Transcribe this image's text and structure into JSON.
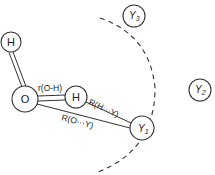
{
  "diagram": {
    "atoms": {
      "h_top": {
        "label": "H",
        "cx": 11,
        "cy": 42,
        "r": 10
      },
      "o": {
        "label": "O",
        "cx": 25,
        "cy": 99,
        "r": 13
      },
      "h_right": {
        "label": "H",
        "cx": 76,
        "cy": 97,
        "r": 11
      }
    },
    "neighbors": {
      "y1": {
        "label": "Y",
        "sub": "1",
        "cx": 142,
        "cy": 128,
        "r": 12
      },
      "y2": {
        "label": "Y",
        "sub": "2",
        "cx": 200,
        "cy": 90,
        "r": 11
      },
      "y3": {
        "label": "Y",
        "sub": "3",
        "cx": 134,
        "cy": 16,
        "r": 11
      }
    },
    "labels": {
      "r_oh": "r(O-H)",
      "r_hy": "R(H···Y)",
      "r_oy": "R(O···Y)"
    },
    "colors": {
      "stroke": "#333333",
      "background": "#ffffff"
    }
  }
}
